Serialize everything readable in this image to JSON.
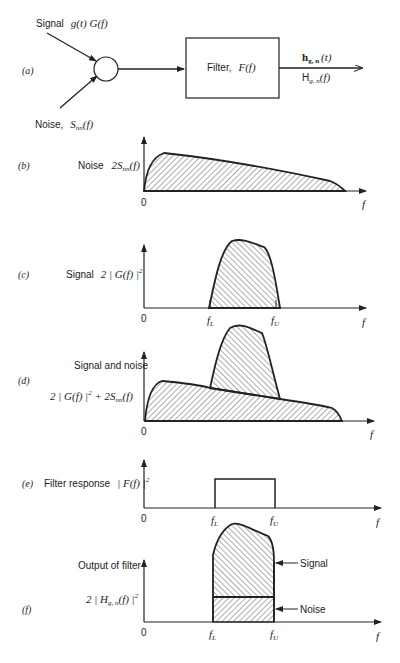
{
  "part_a": {
    "label": "(a)",
    "signal_input": "Signal g(t) G(f)",
    "signal_word": "Signal",
    "signal_math": "g(t) G(f)",
    "noise_word": "Noise,",
    "noise_S": "S",
    "noise_sub": "nn",
    "noise_f": "(f)",
    "filter_label": "Filter, F(f)",
    "filter_word": "Filter,",
    "filter_math": "F(f)",
    "output_time_h": "h",
    "output_time_sub": "g, n",
    "output_time_arg": "(t)",
    "output_freq_H": "H",
    "output_freq_sub": "g, n",
    "output_freq_arg": "(f)"
  },
  "part_b": {
    "label": "(b)",
    "ylabel_word": "Noise",
    "ylabel_math": "2S",
    "ylabel_sub": "nn",
    "ylabel_arg": "(f)",
    "origin": "0",
    "xaxis": "f"
  },
  "part_c": {
    "label": "(c)",
    "ylabel_word": "Signal",
    "ylabel_math": "2 | G(f) |",
    "ylabel_sup": "2",
    "origin": "0",
    "fL": "f",
    "fL_sub": "L",
    "fU": "f",
    "fU_sub": "U",
    "xaxis": "f"
  },
  "part_d": {
    "label": "(d)",
    "ylabel_line1": "Signal and noise",
    "ylabel_line2_a": "2 | G(f) |",
    "ylabel_line2_sup": "2",
    "ylabel_line2_b": " + 2S",
    "ylabel_line2_sub": "nn",
    "ylabel_line2_c": "(f)",
    "origin": "0",
    "xaxis": "f"
  },
  "part_e": {
    "label": "(e)",
    "ylabel_word": "Filter response",
    "ylabel_math": "| F(f) |",
    "ylabel_sup": "2",
    "origin": "0",
    "fL": "f",
    "fL_sub": "L",
    "fU": "f",
    "fU_sub": "U",
    "xaxis": "f"
  },
  "part_f": {
    "label": "(f)",
    "ylabel_line1": "Output of filter",
    "ylabel_line2_a": "2 | H",
    "ylabel_line2_sub": "g, n",
    "ylabel_line2_b": "(f) |",
    "ylabel_line2_sup": "2",
    "signal_annotation": "Signal",
    "noise_annotation": "Noise",
    "origin": "0",
    "fL": "f",
    "fL_sub": "L",
    "fU": "f",
    "fU_sub": "U",
    "xaxis": "f"
  }
}
